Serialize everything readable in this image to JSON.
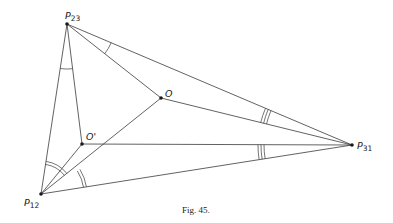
{
  "figure": {
    "caption": "Fig. 45.",
    "points": {
      "P23": {
        "label": "P",
        "sub": "23",
        "x": 67,
        "y": 24
      },
      "O": {
        "label": "O",
        "x": 161,
        "y": 98
      },
      "O_prime": {
        "label": "O'",
        "x": 82,
        "y": 144
      },
      "P12": {
        "label": "P",
        "sub": "12",
        "x": 41,
        "y": 194
      },
      "P31": {
        "label": "P",
        "sub": "31",
        "x": 352,
        "y": 145
      }
    },
    "edges": [
      [
        "P23",
        "P31"
      ],
      [
        "P23",
        "O"
      ],
      [
        "P23",
        "P12"
      ],
      [
        "P23",
        "O_prime"
      ],
      [
        "O",
        "P31"
      ],
      [
        "O",
        "P12"
      ],
      [
        "O_prime",
        "P31"
      ],
      [
        "O_prime",
        "P12"
      ],
      [
        "P12",
        "P31"
      ]
    ],
    "angle_marks": [
      {
        "vertex": "P23",
        "between": [
          "P31",
          "O"
        ],
        "arcs": 1
      },
      {
        "vertex": "P23",
        "between": [
          "P12",
          "O_prime"
        ],
        "arcs": 1
      },
      {
        "vertex": "P12",
        "between": [
          "P23",
          "O"
        ],
        "arcs": 2
      },
      {
        "vertex": "P12",
        "between": [
          "O_prime",
          "P31"
        ],
        "arcs": 2
      },
      {
        "vertex": "P31",
        "between": [
          "P23",
          "O"
        ],
        "arcs": 3
      },
      {
        "vertex": "P31",
        "between": [
          "O_prime",
          "P12"
        ],
        "arcs": 3
      }
    ]
  }
}
